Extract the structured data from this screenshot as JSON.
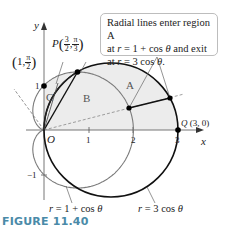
{
  "figure": {
    "caption": "FIGURE 11.40",
    "callout": {
      "line1": "Radial lines enter region A",
      "line2_prefix": "at ",
      "line2_r": "r",
      "line2_mid": " = 1 + cos ",
      "line2_theta": "θ",
      "line2_suffix": " and exit",
      "line3_prefix": "at ",
      "line3_r": "r",
      "line3_mid": " = 3 cos ",
      "line3_theta": "θ",
      "line3_suffix": "."
    },
    "axes": {
      "x_label": "x",
      "y_label": "y",
      "origin_label": "O",
      "x_ticks": [
        "1",
        "2",
        "3"
      ],
      "y_ticks": [
        "1",
        "−1"
      ]
    },
    "regions": {
      "A": "A",
      "B": "B",
      "C": "C"
    },
    "points": {
      "P": {
        "name": "P",
        "r_num": "3",
        "r_den": "2",
        "theta_num": "π",
        "theta_den": "3"
      },
      "C_point": {
        "r": "1",
        "theta_num": "π",
        "theta_den": "2"
      },
      "Q": {
        "name": "Q",
        "coords": "(3, 0)"
      }
    },
    "curves": {
      "cardioid": {
        "label_r": "r",
        "label_rest": " = 1 + cos ",
        "label_theta": "θ",
        "color": "#7a7a7a"
      },
      "circle": {
        "label_r": "r",
        "label_rest": " = 3 cos ",
        "label_theta": "θ",
        "color": "#111111"
      }
    },
    "colors": {
      "shade": "#ececec",
      "caption": "#4a8aa8",
      "axis": "#777777"
    }
  },
  "chart_data": {
    "type": "polar-diagram",
    "title": "FIGURE 11.40",
    "curves": [
      {
        "name": "r = 1 + cos θ",
        "kind": "cardioid"
      },
      {
        "name": "r = 3 cos θ",
        "kind": "circle",
        "center": [
          1.5,
          0
        ],
        "radius": 1.5
      }
    ],
    "points": [
      {
        "label": "P(3/2, π/3)",
        "polar": [
          1.5,
          1.0472
        ]
      },
      {
        "label": "(1, π/2)",
        "polar": [
          1,
          1.5708
        ]
      },
      {
        "label": "Q(3, 0)",
        "polar": [
          3,
          0
        ]
      },
      {
        "label": "O",
        "cartesian": [
          0,
          0
        ]
      }
    ],
    "regions": [
      "A",
      "B",
      "C"
    ],
    "xlim": [
      -1,
      3.3
    ],
    "ylim": [
      -1.9,
      2.4
    ],
    "x_ticks": [
      1,
      2,
      3
    ],
    "y_ticks": [
      1,
      -1
    ]
  }
}
